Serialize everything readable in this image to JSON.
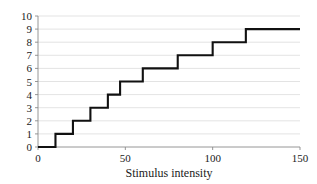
{
  "chart_data": {
    "type": "line",
    "subtype": "step",
    "title": "",
    "xlabel": "Stimulus intensity",
    "ylabel": "",
    "xlim": [
      0,
      150
    ],
    "ylim": [
      0,
      10
    ],
    "xticks": [
      0,
      50,
      100,
      150
    ],
    "xtick_labels": [
      "0",
      "50",
      "100",
      "150"
    ],
    "yticks": [
      0,
      1,
      2,
      3,
      4,
      5,
      6,
      7,
      8,
      9,
      10
    ],
    "ytick_labels": [
      "0",
      "1",
      "2",
      "3",
      "4",
      "5",
      "6",
      "7",
      "8",
      "9",
      "10"
    ],
    "grid": "horizontal",
    "legend": "none",
    "line_color": "#111111",
    "grid_color": "#dcdcdc",
    "axis_color": "#8a8a8a",
    "series": [
      {
        "name": "response",
        "step_points": [
          {
            "x": 0,
            "y": 0
          },
          {
            "x": 10,
            "y": 0
          },
          {
            "x": 10,
            "y": 1
          },
          {
            "x": 20,
            "y": 1
          },
          {
            "x": 20,
            "y": 2
          },
          {
            "x": 30,
            "y": 2
          },
          {
            "x": 30,
            "y": 3
          },
          {
            "x": 40,
            "y": 3
          },
          {
            "x": 40,
            "y": 4
          },
          {
            "x": 47,
            "y": 4
          },
          {
            "x": 47,
            "y": 5
          },
          {
            "x": 60,
            "y": 5
          },
          {
            "x": 60,
            "y": 6
          },
          {
            "x": 80,
            "y": 6
          },
          {
            "x": 80,
            "y": 7
          },
          {
            "x": 100,
            "y": 7
          },
          {
            "x": 100,
            "y": 8
          },
          {
            "x": 119,
            "y": 8
          },
          {
            "x": 119,
            "y": 9
          },
          {
            "x": 150,
            "y": 9
          }
        ]
      }
    ]
  },
  "plot_geometry": {
    "left_px": 38,
    "right_px": 300,
    "bottom_px": 147,
    "top_px": 16
  }
}
